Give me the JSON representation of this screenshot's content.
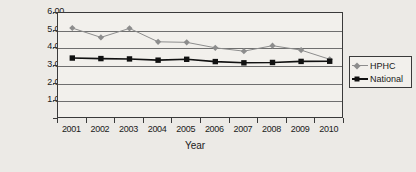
{
  "chart_data": {
    "type": "line",
    "title": "",
    "xlabel": "Year",
    "ylabel": "",
    "categories": [
      "2001",
      "2002",
      "2003",
      "2004",
      "2005",
      "2006",
      "2007",
      "2008",
      "2009",
      "2010"
    ],
    "ylim": [
      0,
      6
    ],
    "ytick_labels": [
      "6.00",
      "5.00",
      "4.00",
      "3.00",
      "2.00",
      "1.00",
      "-"
    ],
    "ytick_values": [
      6,
      5,
      4,
      3,
      2,
      1,
      0
    ],
    "grid": true,
    "legend_position": "right",
    "series": [
      {
        "name": "HPHC",
        "color": "#8d8d8d",
        "marker": "diamond",
        "values": [
          5.15,
          4.62,
          5.13,
          4.37,
          4.34,
          4.03,
          3.84,
          4.15,
          3.9,
          3.38
        ]
      },
      {
        "name": "National",
        "color": "#111111",
        "marker": "square",
        "values": [
          3.45,
          3.42,
          3.4,
          3.33,
          3.38,
          3.25,
          3.18,
          3.2,
          3.26,
          3.27
        ]
      }
    ]
  },
  "axis": {
    "x_title": "Year"
  },
  "legend": {
    "items": [
      {
        "label": "HPHC"
      },
      {
        "label": "National"
      }
    ]
  }
}
